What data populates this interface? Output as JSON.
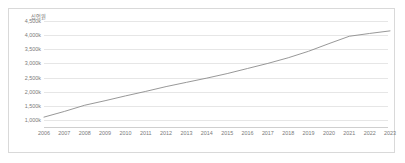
{
  "chart_data": {
    "type": "line",
    "title": "",
    "subtitle": "",
    "xlabel": "",
    "ylabel": "",
    "unit_label": "십억원",
    "grid": true,
    "legend": false,
    "legend_position": "none",
    "line_color": "#8c8c8c",
    "grid_color": "#e6e6e6",
    "axis_color": "#cfcfcf",
    "tick_text_color": "#7a7a7a",
    "categories": [
      "2006",
      "2007",
      "2008",
      "2009",
      "2010",
      "2011",
      "2012",
      "2013",
      "2014",
      "2015",
      "2016",
      "2017",
      "2018",
      "2019",
      "2020",
      "2021",
      "2022",
      "2023"
    ],
    "ytick_labels": [
      "4,500k",
      "4,000k",
      "3,500k",
      "3,000k",
      "2,500k",
      "2,000k",
      "1,500k",
      "1,000k"
    ],
    "ytick_values": [
      4500,
      4000,
      3500,
      3000,
      2500,
      2000,
      1500,
      1000
    ],
    "ylim": [
      750,
      4500
    ],
    "values": [
      1100,
      1300,
      1520,
      1680,
      1850,
      2010,
      2180,
      2330,
      2480,
      2640,
      2820,
      3000,
      3200,
      3430,
      3700,
      3960,
      4060,
      4150
    ]
  }
}
